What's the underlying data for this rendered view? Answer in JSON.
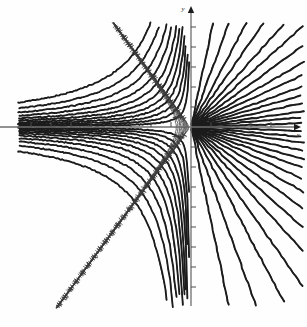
{
  "figure": {
    "title": "Orthogonal net of field lines and equipotential curves",
    "kind": "mathematical-diagram",
    "background_color": "#fefefe",
    "ink_color": "#1c1c1c"
  },
  "axes": {
    "origin": {
      "x": 191,
      "y": 127
    },
    "x_axis": {
      "label": "x",
      "label_position": {
        "x": 298,
        "y": 136
      },
      "start": {
        "x": 0,
        "y": 127
      },
      "end": {
        "x": 301,
        "y": 127
      },
      "arrow": "right",
      "tick_spacing": 20,
      "tick_length": 5,
      "ticks_left": [
        171,
        151,
        131,
        111,
        91,
        71,
        51,
        31
      ],
      "ticks_right": [
        211,
        231,
        251,
        271
      ]
    },
    "y_axis": {
      "label": "y",
      "label_position": {
        "x": 183,
        "y": 10
      },
      "start": {
        "x": 191,
        "y": 6
      },
      "end": {
        "x": 191,
        "y": 306
      },
      "arrow": "up",
      "tick_spacing": 20,
      "tick_length": 5,
      "ticks_up": [
        107,
        87,
        67,
        47,
        27
      ],
      "ticks_down": [
        147,
        167,
        187,
        207,
        227,
        247,
        267,
        287
      ]
    }
  },
  "chart_data": {
    "type": "line",
    "title": "Orthogonal net of field lines and equipotential curves",
    "xlabel": "x",
    "ylabel": "y",
    "grid": false,
    "legend": null,
    "families": [
      {
        "name": "radial-rays",
        "description": "Straight rays emanating from the origin into the right half-plane",
        "style": "thick-solid",
        "stroke_width": 1.9,
        "color": "#1c1c1c",
        "region": "right half-plane",
        "angles_deg": [
          -78,
          -70,
          -62,
          -55,
          -48,
          -42,
          -36,
          -30,
          -25,
          -20,
          -16,
          -12,
          -8,
          -5,
          -2,
          2,
          5,
          8,
          12,
          16,
          20,
          25,
          30,
          36,
          42,
          48,
          55,
          62,
          70,
          78
        ],
        "ray_length": 200
      },
      {
        "name": "smooth-hyperbolic-curves",
        "description": "Thick smooth curves sweeping through the left half-plane, asymptotic to the axes",
        "style": "thick-solid",
        "stroke_width": 1.8,
        "color": "#1c1c1c",
        "region": "left half-plane, mirrored above and below the x-axis",
        "parameters": [
          8,
          16,
          26,
          38,
          52,
          70,
          92,
          120,
          155,
          200,
          260
        ]
      },
      {
        "name": "hatched-orthogonal-curves",
        "description": "Thin curves carrying short perpendicular hatch ticks, orthogonal to the smooth family",
        "style": "thin-hatched",
        "stroke_width": 0.8,
        "hatch_length": 4.2,
        "hatch_spacing": 9,
        "color": "#3a3a3a",
        "region": "left half-plane, mirrored above and below the x-axis",
        "parameters": [
          6,
          13,
          22,
          33,
          47,
          64,
          85,
          112,
          146,
          190,
          245
        ]
      }
    ],
    "xlim": [
      -191,
      116
    ],
    "ylim": [
      -180,
      127
    ]
  }
}
